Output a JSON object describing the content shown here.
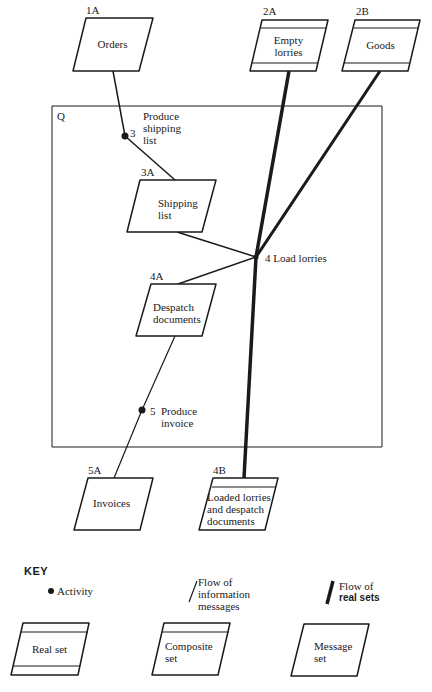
{
  "boundary": {
    "label": "Q"
  },
  "sets": {
    "orders": {
      "id": "1A",
      "name": "Orders",
      "type": "message"
    },
    "empty_lorries": {
      "id": "2A",
      "name_line1": "Empty",
      "name_line2": "lorries",
      "type": "real"
    },
    "goods": {
      "id": "2B",
      "name": "Goods",
      "type": "real"
    },
    "shipping_list": {
      "id": "3A",
      "name_line1": "Shipping",
      "name_line2": "list",
      "type": "message"
    },
    "despatch_documents": {
      "id": "4A",
      "name_line1": "Despatch",
      "name_line2": "documents",
      "type": "message"
    },
    "invoices": {
      "id": "5A",
      "name": "Invoices",
      "type": "message"
    },
    "loaded_lorries": {
      "id": "4B",
      "name_line1": "Loaded lorries",
      "name_line2": "and despatch",
      "name_line3": "documents",
      "type": "composite"
    }
  },
  "activities": {
    "a3": {
      "number": "3",
      "line1": "Produce",
      "line2": "shipping",
      "line3": "list"
    },
    "a4": {
      "number": "4",
      "label": "Load lorries"
    },
    "a5": {
      "number": "5",
      "line1": "Produce",
      "line2": "invoice"
    }
  },
  "key": {
    "title": "KEY",
    "activity": "Activity",
    "info_flow_line1": "Flow of",
    "info_flow_line2": "information",
    "info_flow_line3": "messages",
    "real_flow_line1": "Flow of",
    "real_flow_line2": "real sets",
    "real_set": "Real set",
    "composite_line1": "Composite",
    "composite_line2": "set",
    "message_line1": "Message",
    "message_line2": "set"
  },
  "colors": {
    "ink": "#1a1a1a",
    "background": "#ffffff"
  }
}
